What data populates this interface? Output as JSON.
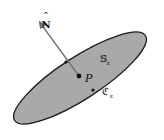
{
  "figure": {
    "surface_label": "𝕊",
    "surface_subscript": "ε",
    "curve_label": "ℭ",
    "curve_subscript": "ε",
    "point_label": "P",
    "normal_label": "N",
    "normal_hat": "^",
    "colors": {
      "surface_fill": "#a9a9a9",
      "outline": "#1a1a1a",
      "arrow": "#707070",
      "background": "#ffffff"
    }
  }
}
